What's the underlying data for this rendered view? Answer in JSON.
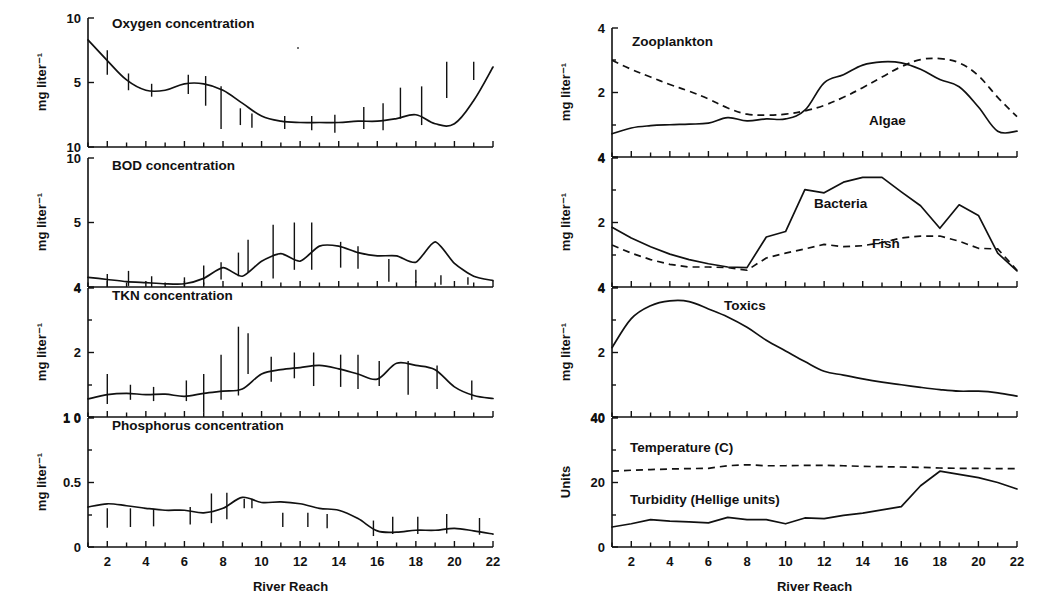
{
  "figure": {
    "xlabel_left": "River Reach",
    "xlabel_right": "River Reach",
    "x_ticklabels": [
      "2",
      "4",
      "6",
      "8",
      "10",
      "12",
      "14",
      "16",
      "18",
      "20",
      "22"
    ],
    "x_tickvalues": [
      2,
      4,
      6,
      8,
      10,
      12,
      14,
      16,
      18,
      20,
      22
    ],
    "xlim": [
      1,
      22
    ],
    "ink_color": "#111111",
    "background_color": "#ffffff"
  },
  "panels": {
    "oxygen": {
      "title": "Oxygen concentration",
      "ylabel": "mg liter⁻¹",
      "yticklabels": [
        "10",
        "5",
        "10"
      ],
      "ytickvalues": [
        10,
        5,
        0
      ]
    },
    "bod": {
      "title": "BOD concentration",
      "ylabel": "mg liter⁻¹",
      "yticklabels": [
        "10",
        "5",
        "4"
      ],
      "ytickvalues": [
        10,
        5,
        0
      ]
    },
    "tkn": {
      "title": "TKN concentration",
      "ylabel": "mg liter⁻¹",
      "yticklabels": [
        "4",
        "2",
        "1 0"
      ],
      "ytickvalues": [
        4,
        2,
        0
      ]
    },
    "phosphorus": {
      "title": "Phosphorus concentration",
      "ylabel": "mg liter⁻¹",
      "yticklabels": [
        "1 0",
        "0.5",
        "0"
      ],
      "ytickvalues": [
        1.0,
        0.5,
        0
      ]
    },
    "plankton": {
      "ylabel": "mg liter⁻¹",
      "yticklabels": [
        "4",
        "2",
        "4"
      ],
      "ytickvalues": [
        4,
        2,
        0
      ],
      "series_labels": [
        "Zooplankton",
        "Algae"
      ]
    },
    "biota": {
      "ylabel": "mg liter⁻¹",
      "yticklabels": [
        "4",
        "2",
        "4"
      ],
      "ytickvalues": [
        4,
        2,
        0
      ],
      "series_labels": [
        "Bacteria",
        "Fish"
      ]
    },
    "toxics": {
      "ylabel": "mg liter⁻¹",
      "yticklabels": [
        "4",
        "2",
        "40"
      ],
      "ytickvalues": [
        4,
        2,
        0
      ],
      "series_labels": [
        "Toxics"
      ]
    },
    "units": {
      "ylabel": "Units",
      "yticklabels": [
        "40",
        "20",
        "0"
      ],
      "ytickvalues": [
        40,
        20,
        0
      ],
      "series_labels": [
        "Temperature (C)",
        "Turbidity (Hellige units)"
      ]
    }
  },
  "chart_data": [
    {
      "id": "oxygen",
      "type": "line",
      "title": "Oxygen concentration",
      "xlabel": "River Reach",
      "ylabel": "mg liter-1",
      "xlim": [
        1,
        22
      ],
      "ylim": [
        0,
        10
      ],
      "grid": false,
      "legend": "none",
      "x": [
        1,
        2,
        3,
        4,
        5,
        6,
        7,
        8,
        9,
        10,
        11,
        12,
        13,
        14,
        15,
        16,
        17,
        18,
        19,
        20,
        21,
        22
      ],
      "series": [
        {
          "name": "Oxygen concentration",
          "style": "solid",
          "values": [
            8.3,
            6.7,
            5.2,
            4.4,
            4.4,
            4.9,
            4.9,
            4.4,
            3.4,
            2.4,
            2.0,
            1.9,
            1.9,
            1.9,
            2.0,
            2.0,
            2.2,
            2.5,
            1.8,
            1.8,
            3.6,
            6.2,
            7.7
          ]
        }
      ],
      "errorbars": [
        {
          "x": 2.0,
          "low": 5.6,
          "high": 7.5
        },
        {
          "x": 3.1,
          "low": 4.4,
          "high": 5.7
        },
        {
          "x": 4.3,
          "low": 3.9,
          "high": 4.9
        },
        {
          "x": 6.2,
          "low": 4.1,
          "high": 5.6
        },
        {
          "x": 7.1,
          "low": 3.2,
          "high": 5.5
        },
        {
          "x": 7.9,
          "low": 1.4,
          "high": 4.7
        },
        {
          "x": 8.9,
          "low": 1.7,
          "high": 3.0
        },
        {
          "x": 9.5,
          "low": 1.5,
          "high": 2.6
        },
        {
          "x": 11.2,
          "low": 1.4,
          "high": 2.4
        },
        {
          "x": 12.6,
          "low": 1.3,
          "high": 2.4
        },
        {
          "x": 13.8,
          "low": 1.1,
          "high": 2.5
        },
        {
          "x": 15.3,
          "low": 1.4,
          "high": 3.1
        },
        {
          "x": 16.3,
          "low": 1.3,
          "high": 3.4
        },
        {
          "x": 17.2,
          "low": 2.2,
          "high": 4.6
        },
        {
          "x": 18.3,
          "low": 1.7,
          "high": 4.7
        },
        {
          "x": 19.6,
          "low": 3.8,
          "high": 6.6
        },
        {
          "x": 21.0,
          "low": 5.2,
          "high": 6.6
        }
      ]
    },
    {
      "id": "bod",
      "type": "line",
      "title": "BOD concentration",
      "xlabel": "River Reach",
      "ylabel": "mg liter-1",
      "xlim": [
        1,
        22
      ],
      "ylim": [
        4,
        10
      ],
      "grid": false,
      "legend": "none",
      "x": [
        1,
        2,
        3,
        4,
        5,
        6,
        7,
        8,
        9,
        10,
        11,
        12,
        13,
        14,
        15,
        16,
        17,
        18,
        19,
        20,
        21,
        22
      ],
      "series": [
        {
          "name": "BOD concentration",
          "style": "solid",
          "values": [
            4.45,
            4.35,
            4.25,
            4.2,
            4.15,
            4.15,
            4.4,
            4.9,
            4.5,
            5.2,
            5.55,
            5.2,
            5.9,
            5.9,
            5.6,
            5.45,
            5.45,
            5.15,
            6.1,
            5.1,
            4.5,
            4.3,
            4.25
          ]
        }
      ],
      "errorbars": [
        {
          "x": 2.0,
          "low": 4.0,
          "high": 4.6
        },
        {
          "x": 3.1,
          "low": 4.05,
          "high": 4.75
        },
        {
          "x": 4.3,
          "low": 4.0,
          "high": 4.5
        },
        {
          "x": 6.0,
          "low": 4.05,
          "high": 4.45
        },
        {
          "x": 7.0,
          "low": 4.1,
          "high": 5.0
        },
        {
          "x": 7.9,
          "low": 4.35,
          "high": 5.15
        },
        {
          "x": 8.8,
          "low": 4.5,
          "high": 5.6
        },
        {
          "x": 9.3,
          "low": 4.7,
          "high": 6.2
        },
        {
          "x": 10.6,
          "low": 4.4,
          "high": 6.9
        },
        {
          "x": 11.7,
          "low": 4.8,
          "high": 7.0
        },
        {
          "x": 12.6,
          "low": 4.8,
          "high": 7.0
        },
        {
          "x": 14.1,
          "low": 4.9,
          "high": 6.1
        },
        {
          "x": 15.0,
          "low": 4.85,
          "high": 5.9
        },
        {
          "x": 16.6,
          "low": 4.25,
          "high": 5.3
        },
        {
          "x": 18.0,
          "low": 4.2,
          "high": 4.8
        },
        {
          "x": 19.3,
          "low": 4.1,
          "high": 4.55
        },
        {
          "x": 20.7,
          "low": 4.1,
          "high": 4.45
        }
      ]
    },
    {
      "id": "tkn",
      "type": "line",
      "title": "TKN concentration",
      "xlabel": "River Reach",
      "ylabel": "mg liter-1",
      "xlim": [
        1,
        22
      ],
      "ylim": [
        1.0,
        4.0
      ],
      "grid": false,
      "legend": "none",
      "x": [
        1,
        2,
        3,
        4,
        5,
        6,
        7,
        8,
        9,
        10,
        11,
        12,
        13,
        14,
        15,
        16,
        17,
        18,
        19,
        20,
        21,
        22
      ],
      "series": [
        {
          "name": "TKN concentration",
          "style": "solid",
          "values": [
            1.42,
            1.52,
            1.55,
            1.52,
            1.53,
            1.48,
            1.55,
            1.6,
            1.65,
            2.0,
            2.1,
            2.15,
            2.2,
            2.12,
            2.0,
            1.88,
            2.25,
            2.2,
            2.1,
            1.7,
            1.5,
            1.43,
            1.4
          ]
        }
      ],
      "errorbars": [
        {
          "x": 2.0,
          "low": 1.3,
          "high": 2.0
        },
        {
          "x": 3.2,
          "low": 1.4,
          "high": 1.75
        },
        {
          "x": 4.4,
          "low": 1.37,
          "high": 1.7
        },
        {
          "x": 6.1,
          "low": 1.37,
          "high": 1.85
        },
        {
          "x": 7.0,
          "low": 1.1,
          "high": 2.0
        },
        {
          "x": 7.9,
          "low": 1.4,
          "high": 2.45
        },
        {
          "x": 8.8,
          "low": 1.5,
          "high": 3.1
        },
        {
          "x": 9.3,
          "low": 2.0,
          "high": 2.95
        },
        {
          "x": 10.5,
          "low": 1.82,
          "high": 2.4
        },
        {
          "x": 11.7,
          "low": 1.9,
          "high": 2.5
        },
        {
          "x": 12.7,
          "low": 1.72,
          "high": 2.5
        },
        {
          "x": 14.1,
          "low": 1.7,
          "high": 2.45
        },
        {
          "x": 15.0,
          "low": 1.65,
          "high": 2.45
        },
        {
          "x": 16.1,
          "low": 1.72,
          "high": 2.3
        },
        {
          "x": 17.6,
          "low": 1.52,
          "high": 2.3
        },
        {
          "x": 19.1,
          "low": 1.65,
          "high": 2.2
        },
        {
          "x": 20.9,
          "low": 1.4,
          "high": 1.85
        }
      ]
    },
    {
      "id": "phosphorus",
      "type": "line",
      "title": "Phosphorus concentration",
      "xlabel": "River Reach",
      "ylabel": "mg liter-1",
      "xlim": [
        1,
        22
      ],
      "ylim": [
        0,
        1.0
      ],
      "grid": false,
      "legend": "none",
      "x": [
        1,
        2,
        3,
        4,
        5,
        6,
        7,
        8,
        9,
        10,
        11,
        12,
        13,
        14,
        15,
        16,
        17,
        18,
        19,
        20,
        21,
        22
      ],
      "series": [
        {
          "name": "Phosphorus concentration",
          "style": "solid",
          "values": [
            0.31,
            0.335,
            0.32,
            0.3,
            0.285,
            0.285,
            0.265,
            0.3,
            0.385,
            0.345,
            0.35,
            0.335,
            0.3,
            0.285,
            0.22,
            0.125,
            0.115,
            0.13,
            0.13,
            0.145,
            0.125,
            0.1,
            0.085
          ]
        }
      ],
      "errorbars": [
        {
          "x": 2.0,
          "low": 0.15,
          "high": 0.3
        },
        {
          "x": 3.2,
          "low": 0.155,
          "high": 0.3
        },
        {
          "x": 4.4,
          "low": 0.16,
          "high": 0.295
        },
        {
          "x": 6.3,
          "low": 0.175,
          "high": 0.31
        },
        {
          "x": 7.4,
          "low": 0.185,
          "high": 0.415
        },
        {
          "x": 8.2,
          "low": 0.215,
          "high": 0.42
        },
        {
          "x": 9.1,
          "low": 0.3,
          "high": 0.375
        },
        {
          "x": 9.5,
          "low": 0.3,
          "high": 0.375
        },
        {
          "x": 11.1,
          "low": 0.155,
          "high": 0.265
        },
        {
          "x": 12.4,
          "low": 0.155,
          "high": 0.265
        },
        {
          "x": 13.4,
          "low": 0.145,
          "high": 0.255
        },
        {
          "x": 15.8,
          "low": 0.085,
          "high": 0.205
        },
        {
          "x": 16.8,
          "low": 0.1,
          "high": 0.235
        },
        {
          "x": 18.1,
          "low": 0.1,
          "high": 0.235
        },
        {
          "x": 19.6,
          "low": 0.105,
          "high": 0.255
        },
        {
          "x": 21.3,
          "low": 0.095,
          "high": 0.225
        }
      ]
    },
    {
      "id": "plankton",
      "type": "line",
      "xlabel": "River Reach",
      "ylabel": "mg liter-1",
      "xlim": [
        1,
        22
      ],
      "ylim": [
        0,
        4
      ],
      "grid": false,
      "legend": "inline-annotations",
      "annotations": [
        "Zooplankton",
        "Algae"
      ],
      "x": [
        1,
        2,
        3,
        4,
        5,
        6,
        7,
        8,
        9,
        10,
        11,
        12,
        13,
        14,
        15,
        16,
        17,
        18,
        19,
        20,
        21,
        22
      ],
      "series": [
        {
          "name": "Zooplankton",
          "style": "dashed",
          "values": [
            3.0,
            2.72,
            2.48,
            2.25,
            2.04,
            1.8,
            1.52,
            1.33,
            1.3,
            1.33,
            1.43,
            1.6,
            1.85,
            2.15,
            2.48,
            2.8,
            3.02,
            3.05,
            2.92,
            2.52,
            1.85,
            1.25,
            0.8
          ]
        },
        {
          "name": "Algae",
          "style": "solid",
          "values": [
            0.72,
            0.9,
            0.97,
            1.0,
            1.02,
            1.05,
            1.22,
            1.12,
            1.18,
            1.18,
            1.45,
            2.3,
            2.55,
            2.85,
            2.95,
            2.92,
            2.72,
            2.4,
            2.18,
            1.55,
            0.8,
            0.8,
            1.02
          ]
        }
      ]
    },
    {
      "id": "biota",
      "type": "line",
      "xlabel": "River Reach",
      "ylabel": "mg liter-1",
      "xlim": [
        1,
        22
      ],
      "ylim": [
        0,
        4
      ],
      "grid": false,
      "legend": "inline-annotations",
      "annotations": [
        "Bacteria",
        "Fish"
      ],
      "x": [
        1,
        2,
        3,
        4,
        5,
        6,
        7,
        8,
        9,
        10,
        11,
        12,
        13,
        14,
        15,
        16,
        17,
        18,
        19,
        20,
        21,
        22
      ],
      "series": [
        {
          "name": "Bacteria",
          "style": "solid",
          "values": [
            1.85,
            1.52,
            1.25,
            1.02,
            0.85,
            0.72,
            0.62,
            0.6,
            1.55,
            1.72,
            3.02,
            2.92,
            3.25,
            3.4,
            3.4,
            2.95,
            2.52,
            1.82,
            2.55,
            2.22,
            1.05,
            0.5,
            0.5
          ]
        },
        {
          "name": "Fish",
          "style": "dashed",
          "values": [
            1.3,
            1.05,
            0.85,
            0.7,
            0.62,
            0.62,
            0.6,
            0.52,
            0.9,
            1.05,
            1.18,
            1.32,
            1.25,
            1.28,
            1.38,
            1.52,
            1.58,
            1.58,
            1.42,
            1.2,
            1.18,
            0.52,
            0.52
          ]
        }
      ]
    },
    {
      "id": "toxics",
      "type": "line",
      "xlabel": "River Reach",
      "ylabel": "mg liter-1",
      "xlim": [
        1,
        22
      ],
      "ylim": [
        0,
        4
      ],
      "grid": false,
      "legend": "inline-annotations",
      "annotations": [
        "Toxics"
      ],
      "x": [
        1,
        2,
        3,
        4,
        5,
        6,
        7,
        8,
        9,
        10,
        11,
        12,
        13,
        14,
        15,
        16,
        17,
        18,
        19,
        20,
        21,
        22
      ],
      "series": [
        {
          "name": "Toxics",
          "style": "solid",
          "values": [
            2.15,
            3.05,
            3.45,
            3.6,
            3.58,
            3.35,
            3.1,
            2.78,
            2.38,
            2.05,
            1.72,
            1.42,
            1.3,
            1.18,
            1.08,
            1.0,
            0.92,
            0.85,
            0.8,
            0.8,
            0.75,
            0.65,
            0.62
          ]
        }
      ]
    },
    {
      "id": "units",
      "type": "line",
      "xlabel": "River Reach",
      "ylabel": "Units",
      "xlim": [
        1,
        22
      ],
      "ylim": [
        0,
        40
      ],
      "grid": false,
      "legend": "inline-annotations",
      "annotations": [
        "Temperature (C)",
        "Turbidity (Hellige units)"
      ],
      "x": [
        1,
        2,
        3,
        4,
        5,
        6,
        7,
        8,
        9,
        10,
        11,
        12,
        13,
        14,
        15,
        16,
        17,
        18,
        19,
        20,
        21,
        22
      ],
      "series": [
        {
          "name": "Temperature (C)",
          "style": "dashed",
          "values": [
            23.5,
            23.8,
            24.0,
            24.2,
            24.3,
            24.4,
            25.2,
            25.5,
            25.2,
            25.2,
            25.3,
            25.3,
            25.2,
            25.0,
            24.9,
            24.8,
            24.7,
            24.5,
            24.4,
            24.4,
            24.3,
            24.3,
            24.2
          ]
        },
        {
          "name": "Turbidity (Hellige units)",
          "style": "solid",
          "values": [
            6.2,
            7.2,
            8.5,
            8.0,
            7.8,
            7.5,
            9.2,
            8.5,
            8.5,
            7.2,
            9.0,
            8.8,
            9.8,
            10.5,
            11.5,
            12.5,
            19.0,
            23.5,
            22.5,
            21.5,
            20.0,
            18.0,
            17.5
          ]
        }
      ]
    }
  ]
}
